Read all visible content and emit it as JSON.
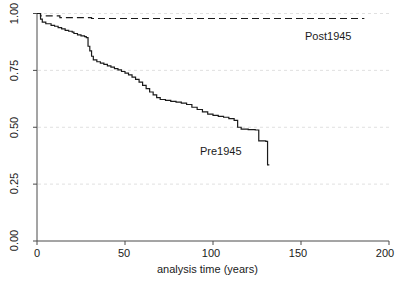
{
  "chart_data": {
    "type": "line",
    "title": "",
    "subtitle": "",
    "xlabel": "analysis time (years)",
    "ylabel": "",
    "xlim": [
      0,
      200
    ],
    "ylim": [
      0,
      1.0
    ],
    "xticks": [
      "0",
      "50",
      "100",
      "150",
      "200"
    ],
    "xtick_values": [
      0,
      50,
      100,
      150,
      200
    ],
    "yticks": [
      "0.00",
      "0.25",
      "0.50",
      "0.75",
      "1.00"
    ],
    "ytick_values": [
      0.0,
      0.25,
      0.5,
      0.75,
      1.0
    ],
    "grid": "horizontal-dashed",
    "legend_position": "inline-annotation",
    "series": [
      {
        "name": "Post1945",
        "style": "dashed",
        "color": "#1a1a1a",
        "label_x": 150,
        "label_y": 0.925,
        "points": [
          [
            0,
            1.0
          ],
          [
            1,
            1.0
          ],
          [
            2,
            0.99
          ],
          [
            12,
            0.99
          ],
          [
            13,
            0.982
          ],
          [
            30,
            0.982
          ],
          [
            31,
            0.978
          ],
          [
            186,
            0.978
          ]
        ]
      },
      {
        "name": "Pre1945",
        "style": "solid",
        "color": "#1a1a1a",
        "label_x": 95,
        "label_y": 0.4,
        "points": [
          [
            0,
            1.0
          ],
          [
            1,
            1.0
          ],
          [
            2,
            0.975
          ],
          [
            3,
            0.962
          ],
          [
            5,
            0.955
          ],
          [
            8,
            0.948
          ],
          [
            10,
            0.944
          ],
          [
            12,
            0.938
          ],
          [
            14,
            0.932
          ],
          [
            16,
            0.926
          ],
          [
            18,
            0.922
          ],
          [
            20,
            0.918
          ],
          [
            21,
            0.912
          ],
          [
            23,
            0.906
          ],
          [
            25,
            0.902
          ],
          [
            27,
            0.898
          ],
          [
            28,
            0.894
          ],
          [
            29,
            0.856
          ],
          [
            30,
            0.836
          ],
          [
            31,
            0.812
          ],
          [
            32,
            0.796
          ],
          [
            34,
            0.788
          ],
          [
            36,
            0.782
          ],
          [
            38,
            0.776
          ],
          [
            40,
            0.77
          ],
          [
            42,
            0.764
          ],
          [
            44,
            0.758
          ],
          [
            46,
            0.752
          ],
          [
            48,
            0.745
          ],
          [
            50,
            0.738
          ],
          [
            52,
            0.73
          ],
          [
            54,
            0.72
          ],
          [
            56,
            0.71
          ],
          [
            58,
            0.698
          ],
          [
            60,
            0.684
          ],
          [
            62,
            0.67
          ],
          [
            64,
            0.655
          ],
          [
            66,
            0.642
          ],
          [
            68,
            0.63
          ],
          [
            70,
            0.622
          ],
          [
            73,
            0.618
          ],
          [
            76,
            0.614
          ],
          [
            79,
            0.61
          ],
          [
            82,
            0.606
          ],
          [
            85,
            0.6
          ],
          [
            88,
            0.588
          ],
          [
            91,
            0.578
          ],
          [
            94,
            0.568
          ],
          [
            97,
            0.558
          ],
          [
            100,
            0.552
          ],
          [
            103,
            0.548
          ],
          [
            106,
            0.544
          ],
          [
            109,
            0.538
          ],
          [
            112,
            0.53
          ],
          [
            114,
            0.5
          ],
          [
            116,
            0.492
          ],
          [
            120,
            0.49
          ],
          [
            124,
            0.488
          ],
          [
            126,
            0.44
          ],
          [
            130,
            0.438
          ],
          [
            131,
            0.335
          ],
          [
            132,
            0.335
          ]
        ]
      }
    ]
  },
  "axes": {
    "x_title": "analysis time (years)",
    "x_tick_labels": [
      "0",
      "50",
      "100",
      "150",
      "200"
    ],
    "y_tick_labels": [
      "0.00",
      "0.25",
      "0.50",
      "0.75",
      "1.00"
    ]
  },
  "annotations": {
    "post_label": "Post1945",
    "pre_label": "Pre1945"
  },
  "colors": {
    "axis": "#4a4a4a",
    "line": "#1a1a1a",
    "grid": "#d8d8d8",
    "background": "#ffffff"
  }
}
